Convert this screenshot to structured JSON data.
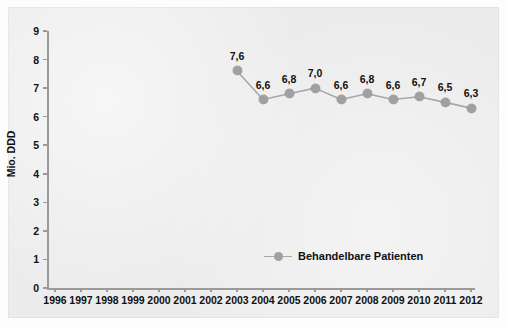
{
  "chart_data": {
    "type": "line",
    "title": "",
    "xlabel": "",
    "ylabel": "Mio. DDD",
    "ylim": [
      0,
      9
    ],
    "ytick_labels": [
      "9",
      "8",
      "7",
      "6",
      "5",
      "4",
      "3",
      "2",
      "1",
      "0"
    ],
    "yticks": [
      9,
      8,
      7,
      6,
      5,
      4,
      3,
      2,
      1,
      0
    ],
    "grid": false,
    "legend_position": "inside-bottom-center",
    "categories": [
      "1996",
      "1997",
      "1998",
      "1999",
      "2000",
      "2001",
      "2002",
      "2003",
      "2004",
      "2005",
      "2006",
      "2007",
      "2008",
      "2009",
      "2010",
      "2011",
      "2012"
    ],
    "series": [
      {
        "name": "Behandelbare Patienten",
        "color": "#a0a0a0",
        "x": [
          "2003",
          "2004",
          "2005",
          "2006",
          "2007",
          "2008",
          "2009",
          "2010",
          "2011",
          "2012"
        ],
        "values": [
          7.6,
          6.6,
          6.8,
          7.0,
          6.6,
          6.8,
          6.6,
          6.7,
          6.5,
          6.3
        ],
        "data_labels": [
          "7,6",
          "6,6",
          "6,8",
          "7,0",
          "6,6",
          "6,8",
          "6,6",
          "6,7",
          "6,5",
          "6,3"
        ]
      }
    ]
  },
  "legend": {
    "items": [
      {
        "label": "Behandelbare Patienten",
        "color": "#a0a0a0"
      }
    ]
  },
  "axes": {
    "y_title": "Mio. DDD"
  }
}
